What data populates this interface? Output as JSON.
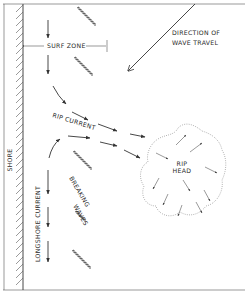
{
  "diagram": {
    "labels": {
      "shore": "SHORE",
      "surf_zone": "SURF ZONE",
      "direction": [
        "DIRECTION OF",
        "WAVE TRAVEL"
      ],
      "rip_current": "RIP CURRENT",
      "rip_head": [
        "RIP",
        "HEAD"
      ],
      "breaking_waves": [
        "BREAKING",
        "WAVES"
      ],
      "longshore_current": "LONGSHORE CURRENT"
    },
    "colors": {
      "line": "#333333",
      "background": "#ffffff",
      "dotted": "#777777"
    }
  }
}
